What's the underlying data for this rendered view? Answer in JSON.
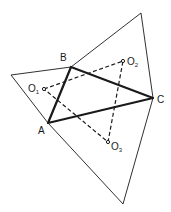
{
  "diagram": {
    "colors": {
      "stroke": "#1a1a1a",
      "background": "#ffffff"
    },
    "outer_vertices": {
      "left": [
        11,
        75
      ],
      "top": [
        141,
        13
      ],
      "bottom": [
        123,
        204
      ]
    },
    "triangle_abc": {
      "A": [
        48,
        123
      ],
      "B": [
        71,
        67
      ],
      "C": [
        153,
        98
      ]
    },
    "centers": {
      "O1": [
        44,
        89
      ],
      "O2": [
        123,
        61
      ],
      "O3": [
        108,
        142
      ]
    },
    "labels": {
      "A": {
        "text": "A",
        "pos": [
          38,
          134
        ]
      },
      "B": {
        "text": "B",
        "pos": [
          60,
          61
        ]
      },
      "C": {
        "text": "C",
        "pos": [
          157,
          103
        ]
      },
      "O1": {
        "main": "O",
        "sub": "1",
        "pos": [
          28,
          92
        ]
      },
      "O2": {
        "main": "O",
        "sub": "2",
        "pos": [
          127,
          65
        ]
      },
      "O3": {
        "main": "O",
        "sub": "3",
        "pos": [
          111,
          150
        ]
      }
    }
  }
}
